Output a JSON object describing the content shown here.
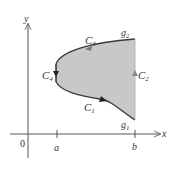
{
  "diagram": {
    "axes": {
      "x_label": "x",
      "y_label": "y",
      "origin_label": "0",
      "tick_labels": [
        "a",
        "b"
      ]
    },
    "curves": {
      "c1": {
        "label": "C",
        "sub": "1"
      },
      "c2": {
        "label": "C",
        "sub": "2"
      },
      "c3": {
        "label": "C",
        "sub": "3"
      },
      "c4": {
        "label": "C",
        "sub": "4"
      },
      "g1": {
        "label": "g",
        "sub": "1"
      },
      "g2": {
        "label": "g",
        "sub": "2"
      }
    },
    "colors": {
      "region_fill": "#c8c8c8",
      "boundary": "#3a3a3a",
      "axis": "#555555",
      "arrow_c2": "#888888"
    }
  }
}
